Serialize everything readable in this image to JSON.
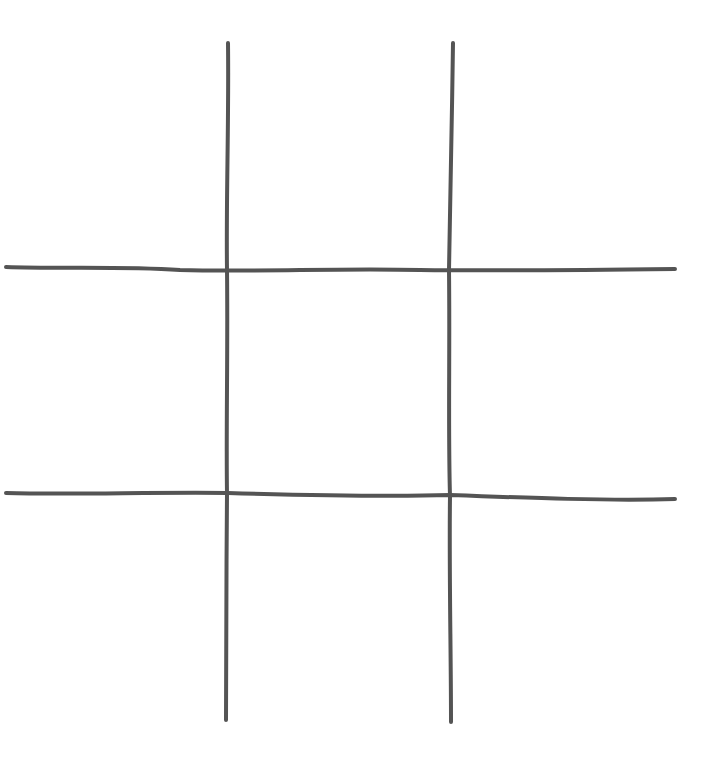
{
  "game": {
    "type": "tic-tac-toe",
    "grid_size": 3,
    "line_color": "#545454",
    "background": "#ffffff",
    "cells": [
      "",
      "",
      "",
      "",
      "",
      "",
      "",
      "",
      ""
    ]
  }
}
